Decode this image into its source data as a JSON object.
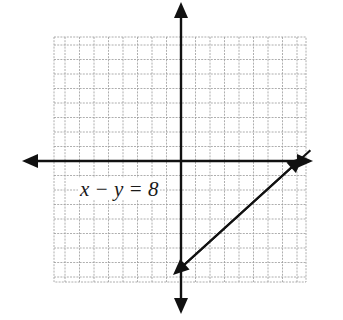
{
  "figure": {
    "equation_label": "x − y = 8",
    "grid": {
      "x_min": -9,
      "x_max": 9,
      "y_min": -8,
      "y_max": 9,
      "spacing_px": 14.5,
      "origin_px": [
        181,
        161
      ],
      "left_px": 54,
      "right_px": 306,
      "top_px": 37,
      "bottom_px": 282,
      "line_color": "#9a9a9a"
    },
    "axes": {
      "color": "#111111",
      "x_axis": {
        "from_px": 22,
        "to_px": 313
      },
      "y_axis": {
        "from_px": 2,
        "to_px": 314
      }
    },
    "line": {
      "equation": "x - y = 8",
      "points": [
        [
          8,
          0
        ],
        [
          0,
          -8
        ]
      ],
      "color": "#111111",
      "arrows": "both"
    }
  }
}
